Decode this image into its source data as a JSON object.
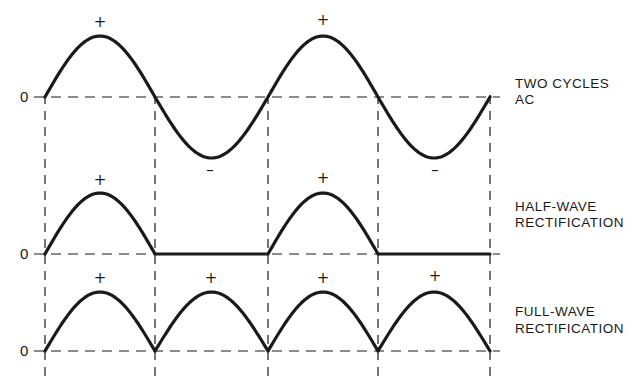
{
  "colors": {
    "ink": "#1a1a1a",
    "background": "#ffffff"
  },
  "grid": {
    "x": [
      45,
      155,
      268,
      378,
      490
    ]
  },
  "panels": [
    {
      "id": "ac",
      "label_lines": [
        "TWO CYCLES",
        "AC"
      ],
      "zero_label": "0",
      "baseline_y": 97,
      "amplitude": 61,
      "signs": [
        {
          "text": "+",
          "x": 100,
          "y": 27
        },
        {
          "text": "–",
          "x": 210,
          "y": 175
        },
        {
          "text": "+",
          "x": 323,
          "y": 25
        },
        {
          "text": "–",
          "x": 435,
          "y": 175
        }
      ]
    },
    {
      "id": "half-wave",
      "label_lines": [
        "HALF-WAVE",
        "RECTIFICATION"
      ],
      "zero_label": "0",
      "baseline_y": 254,
      "amplitude": 61,
      "signs": [
        {
          "text": "+",
          "x": 100,
          "y": 185
        },
        {
          "text": "+",
          "x": 323,
          "y": 183
        }
      ]
    },
    {
      "id": "full-wave",
      "label_lines": [
        "FULL-WAVE",
        "RECTIFICATION"
      ],
      "zero_label": "0",
      "baseline_y": 351,
      "amplitude": 59,
      "signs": [
        {
          "text": "+",
          "x": 100,
          "y": 283
        },
        {
          "text": "+",
          "x": 211,
          "y": 283
        },
        {
          "text": "+",
          "x": 323,
          "y": 283
        },
        {
          "text": "+",
          "x": 435,
          "y": 281
        }
      ]
    }
  ]
}
